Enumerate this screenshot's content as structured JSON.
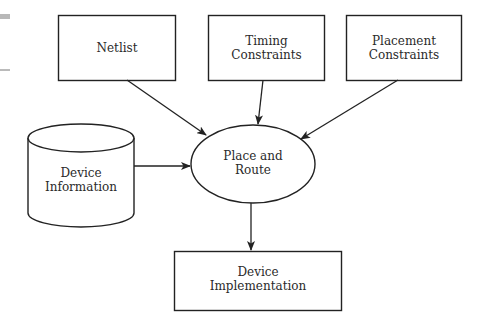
{
  "diagram": {
    "type": "flowchart",
    "stroke_color": "#222222",
    "fill_color": "#ffffff",
    "nodes": {
      "netlist": {
        "shape": "rectangle",
        "lines": [
          "Netlist"
        ]
      },
      "timing": {
        "shape": "rectangle",
        "lines": [
          "Timing",
          "Constraints"
        ]
      },
      "placement": {
        "shape": "rectangle",
        "lines": [
          "Placement",
          "Constraints"
        ]
      },
      "device_info": {
        "shape": "cylinder",
        "lines": [
          "Device",
          "Information"
        ]
      },
      "place_route": {
        "shape": "ellipse",
        "lines": [
          "Place and",
          "Route"
        ]
      },
      "implementation": {
        "shape": "rectangle",
        "lines": [
          "Device",
          "Implementation"
        ]
      }
    },
    "edges": [
      {
        "from": "netlist",
        "to": "place_route"
      },
      {
        "from": "timing",
        "to": "place_route"
      },
      {
        "from": "placement",
        "to": "place_route"
      },
      {
        "from": "device_info",
        "to": "place_route"
      },
      {
        "from": "place_route",
        "to": "implementation"
      }
    ]
  }
}
